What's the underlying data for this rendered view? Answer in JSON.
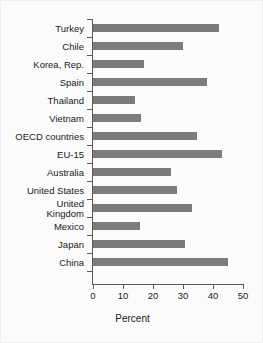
{
  "chart_data": {
    "type": "bar",
    "orientation": "horizontal",
    "title": "",
    "xlabel": "Percent",
    "ylabel": "",
    "xlim": [
      0,
      50
    ],
    "xticks": [
      0,
      10,
      20,
      30,
      40,
      50
    ],
    "xtick_labels": [
      "0",
      "10",
      "20",
      "30",
      "40",
      "50"
    ],
    "grid": false,
    "legend": null,
    "bar_color": "#7b7b7b",
    "axis_color": "#5a5a5a",
    "background_color": "#fbfbfb",
    "categories": [
      "Turkey",
      "Chile",
      "Korea, Rep.",
      "Spain",
      "Thailand",
      "Vietnam",
      "OECD countries",
      "EU-15",
      "Australia",
      "United States",
      "United\nKingdom",
      "Mexico",
      "Japan",
      "China"
    ],
    "values": [
      42,
      30,
      17,
      38,
      14,
      16,
      34.5,
      43,
      26,
      28,
      33,
      15.5,
      30.5,
      45
    ]
  }
}
